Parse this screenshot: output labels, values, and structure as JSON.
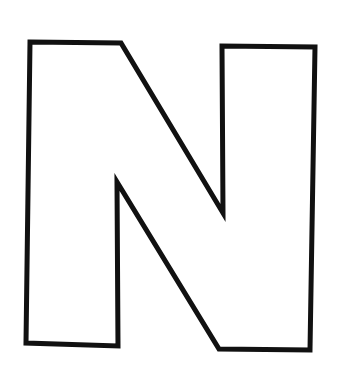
{
  "image": {
    "letter": "N",
    "style": "outline",
    "stroke_color": "#111111",
    "fill_color": "#ffffff",
    "background": "#ffffff"
  }
}
